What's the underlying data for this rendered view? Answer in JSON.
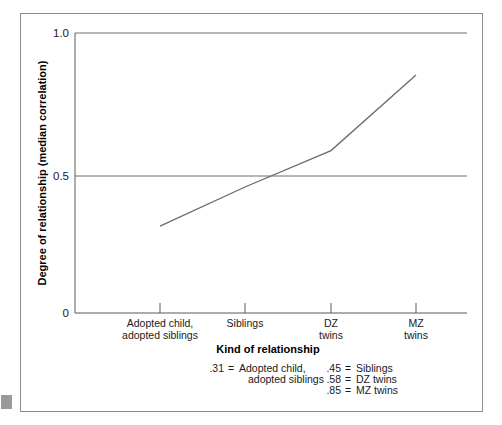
{
  "chart_data": {
    "type": "line",
    "title": "",
    "xlabel": "Kind of relationship",
    "ylabel": "Degree of relationship (median correlation)",
    "categories": [
      "Adopted child, adopted siblings",
      "Siblings",
      "DZ twins",
      "MZ twins"
    ],
    "values": [
      0.31,
      0.45,
      0.58,
      0.85
    ],
    "ylim": [
      0,
      1.0
    ],
    "ytick_labels": [
      "0",
      "0.5",
      "1.0"
    ],
    "ytick_values": [
      0,
      0.5,
      1.0
    ],
    "grid": "horizontal gridlines at 0.5 and 1.0",
    "legend_position": "below x-axis title",
    "line_color": "#6b6b6b",
    "markers": "none"
  },
  "axes": {
    "y_ticks": [
      {
        "label": "1.0",
        "value": 1.0
      },
      {
        "label": "0.5",
        "value": 0.5
      },
      {
        "label": "0",
        "value": 0
      }
    ],
    "y_axis_title": "Degree of relationship (median correlation)",
    "x_axis_title": "Kind of relationship",
    "x_ticks": [
      {
        "line1": "Adopted child,",
        "line2": "adopted siblings",
        "value": 0.31
      },
      {
        "line1": "Siblings",
        "line2": "",
        "value": 0.45
      },
      {
        "line1": "DZ",
        "line2": "twins",
        "value": 0.58
      },
      {
        "line1": "MZ",
        "line2": "twins",
        "value": 0.85
      }
    ]
  },
  "legend": {
    "left_column": [
      {
        "value": ".31",
        "equals": "=",
        "line1": "Adopted child,",
        "line2": "adopted siblings"
      }
    ],
    "right_column": [
      {
        "value": ".45",
        "equals": "=",
        "label": "Siblings"
      },
      {
        "value": ".58",
        "equals": "=",
        "label": "DZ twins"
      },
      {
        "value": ".85",
        "equals": "=",
        "label": "MZ twins"
      }
    ]
  },
  "colors": {
    "line": "#6b6b6b",
    "axis": "#595959",
    "frame": "#8c8c8c",
    "text": "#1a1a1a",
    "background": "#ffffff"
  }
}
